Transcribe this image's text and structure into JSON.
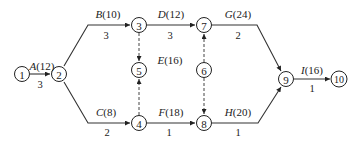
{
  "diagram": {
    "type": "activity-on-arrow network",
    "nodes": [
      {
        "id": "1",
        "label": "1",
        "x": 22,
        "y": 74
      },
      {
        "id": "2",
        "label": "2",
        "x": 59,
        "y": 74
      },
      {
        "id": "3",
        "label": "3",
        "x": 139,
        "y": 25
      },
      {
        "id": "4",
        "label": "4",
        "x": 139,
        "y": 123
      },
      {
        "id": "5",
        "label": "5",
        "x": 139,
        "y": 70
      },
      {
        "id": "6",
        "label": "6",
        "x": 204,
        "y": 70
      },
      {
        "id": "7",
        "label": "7",
        "x": 204,
        "y": 25
      },
      {
        "id": "8",
        "label": "8",
        "x": 204,
        "y": 123
      },
      {
        "id": "9",
        "label": "9",
        "x": 286,
        "y": 79
      },
      {
        "id": "10",
        "label": "10",
        "x": 339,
        "y": 79
      }
    ],
    "activities": [
      {
        "name": "A",
        "value": "(12)",
        "duration": "3",
        "from": "1",
        "to": "2"
      },
      {
        "name": "B",
        "value": "(10)",
        "duration": "3",
        "from": "2",
        "to": "3"
      },
      {
        "name": "C",
        "value": "(8)",
        "duration": "2",
        "from": "2",
        "to": "4"
      },
      {
        "name": "D",
        "value": "(12)",
        "duration": "3",
        "from": "3",
        "to": "7"
      },
      {
        "name": "E",
        "value": "(16)",
        "duration": "",
        "from": "4",
        "to": "5"
      },
      {
        "name": "F",
        "value": "(18)",
        "duration": "1",
        "from": "4",
        "to": "8"
      },
      {
        "name": "G",
        "value": "(24)",
        "duration": "2",
        "from": "7",
        "to": "9"
      },
      {
        "name": "H",
        "value": "(20)",
        "duration": "1",
        "from": "8",
        "to": "9"
      },
      {
        "name": "I",
        "value": "(16)",
        "duration": "1",
        "from": "9",
        "to": "10"
      }
    ],
    "dummy_activities": [
      {
        "from": "3",
        "to": "5"
      },
      {
        "from": "4",
        "to": "5"
      },
      {
        "from": "6",
        "to": "7"
      },
      {
        "from": "6",
        "to": "8"
      }
    ]
  }
}
